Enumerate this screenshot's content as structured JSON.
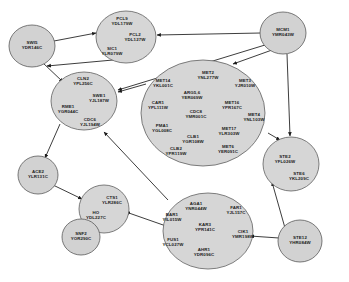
{
  "diagram": {
    "kind": "gene-regulatory-network",
    "background_color": "#ffffff",
    "node_fill": "#d2d2d2",
    "node_stroke": "#5a5a5a",
    "edge_color": "#1a1a1a",
    "width": 349,
    "height": 282
  },
  "nodes": [
    {
      "id": "swi5",
      "label": "SWI5",
      "orf": "YDR146C",
      "type": "single",
      "cx": 32,
      "cy": 46,
      "rx": 23,
      "ry": 21,
      "genes": [
        {
          "name": "SWI5",
          "orf": "YDR146C",
          "x": 32,
          "y": 44
        }
      ]
    },
    {
      "id": "pcl-cluster",
      "label": "PCL9",
      "orf": "YDL179W",
      "type": "cluster",
      "cx": 126,
      "cy": 37,
      "rx": 30,
      "ry": 26,
      "genes": [
        {
          "name": "PCL9",
          "orf": "YDL179W",
          "x": 122,
          "y": 20
        },
        {
          "name": "PCL2",
          "orf": "YDL127W",
          "x": 135,
          "y": 36
        },
        {
          "name": "SIC1",
          "orf": "YLR079W",
          "x": 112,
          "y": 50
        }
      ]
    },
    {
      "id": "mcm1",
      "label": "MCM1",
      "orf": "YMR043W",
      "type": "single",
      "cx": 283,
      "cy": 33,
      "rx": 23,
      "ry": 21,
      "genes": [
        {
          "name": "MCM1",
          "orf": "YMR043W",
          "x": 283,
          "y": 31
        }
      ]
    },
    {
      "id": "cln2-cluster",
      "label": "CLN2",
      "orf": "YPL256C",
      "type": "cluster",
      "cx": 84,
      "cy": 101,
      "rx": 33,
      "ry": 29,
      "genes": [
        {
          "name": "CLN2",
          "orf": "YPL256C",
          "x": 83,
          "y": 80
        },
        {
          "name": "SWE1",
          "orf": "YJL187W",
          "x": 99,
          "y": 97
        },
        {
          "name": "RME1",
          "orf": "YGR044C",
          "x": 68,
          "y": 108
        },
        {
          "name": "CDC6",
          "orf": "YJL194W",
          "x": 90,
          "y": 121
        }
      ]
    },
    {
      "id": "met-cluster",
      "label": "MET2",
      "orf": "YNL277W",
      "type": "cluster",
      "cx": 203,
      "cy": 113,
      "rx": 62,
      "ry": 53,
      "genes": [
        {
          "name": "MET14",
          "orf": "YKL001C",
          "x": 163,
          "y": 82
        },
        {
          "name": "MET2",
          "orf": "YNL277W",
          "x": 208,
          "y": 74
        },
        {
          "name": "MET3",
          "orf": "YJR010W",
          "x": 245,
          "y": 82
        },
        {
          "name": "ARG5,6",
          "orf": "YER069W",
          "x": 192,
          "y": 94
        },
        {
          "name": "MET16",
          "orf": "YPR167C",
          "x": 232,
          "y": 104
        },
        {
          "name": "CAR1",
          "orf": "YPL111W",
          "x": 158,
          "y": 104
        },
        {
          "name": "CDC8",
          "orf": "YMR001C",
          "x": 196,
          "y": 113
        },
        {
          "name": "MET4",
          "orf": "YNL103W",
          "x": 254,
          "y": 116
        },
        {
          "name": "PMA1",
          "orf": "YGL008C",
          "x": 162,
          "y": 127
        },
        {
          "name": "MET17",
          "orf": "YLR303W",
          "x": 229,
          "y": 130
        },
        {
          "name": "CLB1",
          "orf": "YGR108W",
          "x": 193,
          "y": 138
        },
        {
          "name": "CLB2",
          "orf": "YPR119W",
          "x": 176,
          "y": 150
        },
        {
          "name": "MET6",
          "orf": "YER091C",
          "x": 228,
          "y": 148
        }
      ]
    },
    {
      "id": "ste2-cluster",
      "label": "STE2",
      "orf": "YFL026W",
      "type": "cluster",
      "cx": 291,
      "cy": 164,
      "rx": 28,
      "ry": 27,
      "genes": [
        {
          "name": "STE2",
          "orf": "YFL026W",
          "x": 285,
          "y": 158
        },
        {
          "name": "STE6",
          "orf": "YKL209C",
          "x": 299,
          "y": 175
        }
      ]
    },
    {
      "id": "ace2",
      "label": "ACE2",
      "orf": "YLR131C",
      "type": "single",
      "cx": 38,
      "cy": 175,
      "rx": 20,
      "ry": 19,
      "genes": [
        {
          "name": "ACE2",
          "orf": "YLR131C",
          "x": 38,
          "y": 173
        }
      ]
    },
    {
      "id": "cts1-cluster",
      "label": "CTS1",
      "orf": "YLR286C",
      "type": "cluster",
      "cx": 104,
      "cy": 209,
      "rx": 25,
      "ry": 24,
      "genes": [
        {
          "name": "CTS1",
          "orf": "YLR286C",
          "x": 112,
          "y": 199
        },
        {
          "name": "HO",
          "orf": "YDL227C",
          "x": 96,
          "y": 214
        }
      ]
    },
    {
      "id": "snf2",
      "label": "SNF2",
      "orf": "YOR290C",
      "type": "single",
      "cx": 81,
      "cy": 237,
      "rx": 19,
      "ry": 18,
      "genes": [
        {
          "name": "SNF2",
          "orf": "YOR290C",
          "x": 81,
          "y": 235
        }
      ]
    },
    {
      "id": "aga1-cluster",
      "label": "AGA1",
      "orf": "YNR044W",
      "type": "cluster",
      "cx": 208,
      "cy": 231,
      "rx": 45,
      "ry": 38,
      "genes": [
        {
          "name": "AGA1",
          "orf": "YNR044W",
          "x": 196,
          "y": 205
        },
        {
          "name": "FAR1",
          "orf": "YJL157C",
          "x": 236,
          "y": 209
        },
        {
          "name": "BAR1",
          "orf": "YIL015W",
          "x": 172,
          "y": 216
        },
        {
          "name": "KAR3",
          "orf": "YPR141C",
          "x": 205,
          "y": 226
        },
        {
          "name": "CIK1",
          "orf": "YMR198W",
          "x": 243,
          "y": 233
        },
        {
          "name": "FUS1",
          "orf": "YCL027W",
          "x": 173,
          "y": 241
        },
        {
          "name": "AHR1",
          "orf": "YDR096C",
          "x": 204,
          "y": 251
        }
      ]
    },
    {
      "id": "ste12",
      "label": "STE12",
      "orf": "YHR084W",
      "type": "single",
      "cx": 300,
      "cy": 241,
      "rx": 22,
      "ry": 21,
      "genes": [
        {
          "name": "STE12",
          "orf": "YHR084W",
          "x": 300,
          "y": 239
        }
      ]
    }
  ],
  "edges": [
    {
      "from": "swi5",
      "to": "pcl-cluster",
      "path": "M 54,41 L 96,33"
    },
    {
      "from": "mcm1",
      "to": "pcl-cluster",
      "path": "M 261,33 L 157,35"
    },
    {
      "from": "pcl-cluster",
      "to": "swi5",
      "path": "M 113,60 L 47,66"
    },
    {
      "from": "mcm1",
      "to": "cln2-cluster",
      "path": "M 265,45 L 118,90"
    },
    {
      "from": "mcm1",
      "to": "met-cluster",
      "path": "M 272,50 L 233,64"
    },
    {
      "from": "met-cluster",
      "to": "cln2-cluster",
      "path": "M 146,84 L 118,92"
    },
    {
      "from": "swi5",
      "to": "cln2-cluster",
      "path": "M 43,63 L 63,82"
    },
    {
      "from": "cln2-cluster",
      "to": "ace2",
      "path": "M 60,124 L 45,158"
    },
    {
      "from": "ace2",
      "to": "cts1-cluster",
      "path": "M 53,185 L 82,199"
    },
    {
      "from": "snf2",
      "to": "cts1-cluster",
      "path": "M 96,229 L 108,220"
    },
    {
      "from": "aga1-cluster",
      "to": "cts1-cluster",
      "path": "M 166,226 L 126,212"
    },
    {
      "from": "ste12",
      "to": "aga1-cluster",
      "path": "M 279,238 L 250,236"
    },
    {
      "from": "ste12",
      "to": "ste2-cluster",
      "path": "M 285,228 L 272,182"
    },
    {
      "from": "met-cluster",
      "to": "ste2-cluster",
      "path": "M 268,133 L 280,140"
    },
    {
      "from": "mcm1",
      "to": "ste2-cluster",
      "path": "M 287,54 L 290,136"
    },
    {
      "from": "aga1-cluster",
      "to": "cln2-cluster",
      "path": "M 168,200 L 104,132"
    }
  ]
}
